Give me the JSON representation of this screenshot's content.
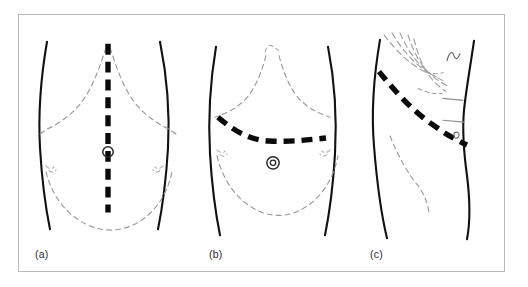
{
  "figure": {
    "panels": [
      {
        "id": "a",
        "label": "(a)",
        "view": "anterior",
        "incision_name": "vertical midline incision",
        "incision_orientation": "vertical",
        "landmarks": [
          "costal margin",
          "umbilicus",
          "pelvic brim",
          "anterior superior iliac spine"
        ]
      },
      {
        "id": "b",
        "label": "(b)",
        "view": "anterior",
        "incision_name": "transverse incision",
        "incision_orientation": "horizontal",
        "landmarks": [
          "costal margin",
          "xiphisternum",
          "umbilicus",
          "pelvic brim",
          "anterior superior iliac spine"
        ]
      },
      {
        "id": "c",
        "label": "(c)",
        "view": "lateral oblique",
        "incision_name": "oblique subcostal incision",
        "incision_orientation": "oblique",
        "landmarks": [
          "ribs",
          "costal margin",
          "iliac crest",
          "scapula"
        ]
      }
    ],
    "colors": {
      "background": "#ffffff",
      "frame_border": "#b9b9bb",
      "body_outline": "#111111",
      "landmark_dashed": "#9a9a9a",
      "incision_line": "#0a0a0a",
      "label_text": "#2b2b2b"
    }
  }
}
